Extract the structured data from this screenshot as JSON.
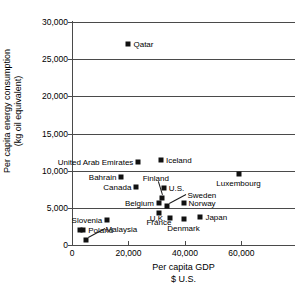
{
  "chart_data": {
    "type": "scatter",
    "title": "",
    "xlabel": "Per capita GDP",
    "xlabel_line2": "$ U.S.",
    "ylabel": "Per capita energy consumption",
    "ylabel_line2": "(kg oil equivalent)",
    "xlim": [
      0,
      79000
    ],
    "ylim": [
      0,
      30000
    ],
    "xticks": [
      "0",
      "20,000",
      "40,000",
      "60,000"
    ],
    "xtick_values": [
      0,
      20000,
      40000,
      60000
    ],
    "yticks": [
      "0",
      "5,000",
      "10,000",
      "15,000",
      "20,000",
      "25,000",
      "30,000"
    ],
    "ytick_values": [
      0,
      5000,
      10000,
      15000,
      20000,
      25000,
      30000
    ],
    "grid": "horizontal",
    "legend": "none",
    "marker_color": "#111111",
    "axis_color": "#4a4a4a",
    "points": [
      {
        "name": "Qatar",
        "x": 20000,
        "y": 27000,
        "label_pos": "right"
      },
      {
        "name": "United Arab Emirates",
        "x": 23500,
        "y": 11200,
        "label_pos": "left"
      },
      {
        "name": "Iceland",
        "x": 31500,
        "y": 11500,
        "label_pos": "right"
      },
      {
        "name": "Luxembourg",
        "x": 59000,
        "y": 9500,
        "label_pos": "below"
      },
      {
        "name": "Bahrain",
        "x": 17500,
        "y": 9200,
        "label_pos": "left"
      },
      {
        "name": "Canada",
        "x": 22800,
        "y": 7800,
        "label_pos": "left"
      },
      {
        "name": "U.S.",
        "x": 32500,
        "y": 7700,
        "label_pos": "right"
      },
      {
        "name": "Finland",
        "x": 31800,
        "y": 6300,
        "label_pos": "leader-above"
      },
      {
        "name": "Belgium",
        "x": 30800,
        "y": 5700,
        "label_pos": "left"
      },
      {
        "name": "Sweden",
        "x": 33800,
        "y": 5300,
        "label_pos": "leader-right"
      },
      {
        "name": "Norway",
        "x": 39500,
        "y": 5700,
        "label_pos": "right"
      },
      {
        "name": "France",
        "x": 30800,
        "y": 4300,
        "label_pos": "below"
      },
      {
        "name": "U.K.",
        "x": 34800,
        "y": 3600,
        "label_pos": "left"
      },
      {
        "name": "Denmark",
        "x": 39500,
        "y": 3500,
        "label_pos": "below"
      },
      {
        "name": "Japan",
        "x": 45500,
        "y": 3800,
        "label_pos": "right"
      },
      {
        "name": "Slovenia",
        "x": 12500,
        "y": 3300,
        "label_pos": "left"
      },
      {
        "name": "Poland",
        "x": 4000,
        "y": 2000,
        "label_pos": "right"
      },
      {
        "name": "Poland-2",
        "x": 2800,
        "y": 2000,
        "label_pos": "none"
      },
      {
        "name": "Malaysia",
        "x": 4800,
        "y": 700,
        "label_pos": "leader-right"
      }
    ]
  }
}
